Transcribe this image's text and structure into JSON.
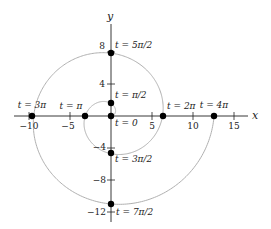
{
  "diagram": {
    "title": "",
    "axes": {
      "x_label": "x",
      "y_label": "y",
      "x_ticks": [
        {
          "value": -10,
          "label": "−10"
        },
        {
          "value": -5,
          "label": "−5"
        },
        {
          "value": 5,
          "label": "5"
        },
        {
          "value": 10,
          "label": "10"
        },
        {
          "value": 15,
          "label": "15"
        }
      ],
      "y_ticks": [
        {
          "value": 8,
          "label": "8"
        },
        {
          "value": 4,
          "label": "4"
        },
        {
          "value": -4,
          "label": "−4"
        },
        {
          "value": -8,
          "label": "−8"
        },
        {
          "value": -12,
          "label": "−12"
        }
      ]
    },
    "curve": {
      "type": "Archimedean spiral r = t",
      "color": "#b0b0b0"
    },
    "points": [
      {
        "t": "0",
        "label": "t = 0",
        "x": 0,
        "y": 0
      },
      {
        "t": "π/2",
        "label": "t = π/2",
        "x": 0,
        "y": 1.571
      },
      {
        "t": "π",
        "label": "t = π",
        "x": -3.142,
        "y": 0
      },
      {
        "t": "3π/2",
        "label": "t = 3π/2",
        "x": 0,
        "y": -4.712
      },
      {
        "t": "2π",
        "label": "t = 2π",
        "x": 6.283,
        "y": 0
      },
      {
        "t": "5π/2",
        "label": "t = 5π/2",
        "x": 0,
        "y": 7.854
      },
      {
        "t": "3π",
        "label": "t = 3π",
        "x": -9.425,
        "y": 0
      },
      {
        "t": "7π/2",
        "label": "t = 7π/2",
        "x": 0,
        "y": -10.996
      },
      {
        "t": "4π",
        "label": "t = 4π",
        "x": 12.566,
        "y": 0
      }
    ],
    "colors": {
      "axis": "#222222",
      "curve": "#b0b0b0",
      "point": "#000000"
    }
  }
}
